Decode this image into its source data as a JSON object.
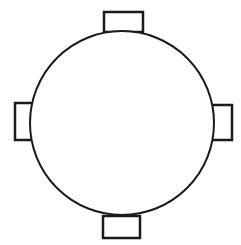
{
  "diagram": {
    "stroke_color": "#1a1a1a",
    "fill_color": "#ffffff",
    "table": {
      "shape": "circle",
      "cx": 122,
      "cy": 123,
      "r": 92
    },
    "chairs": [
      {
        "position": "top",
        "x": 104,
        "y": 12,
        "w": 39,
        "h": 20
      },
      {
        "position": "left",
        "x": 15,
        "y": 103,
        "w": 18,
        "h": 37
      },
      {
        "position": "right",
        "x": 212,
        "y": 105,
        "w": 20,
        "h": 35
      },
      {
        "position": "bottom",
        "x": 103,
        "y": 216,
        "w": 37,
        "h": 22
      }
    ]
  }
}
